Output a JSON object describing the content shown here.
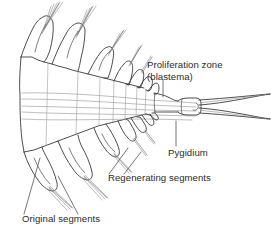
{
  "figure": {
    "background_color": "#ffffff",
    "ink_color": "#3a3a3a",
    "text_color": "#2b2b2b",
    "width": 271,
    "height": 238
  },
  "labels": {
    "proliferation_zone_line1": "Proliferation zone",
    "proliferation_zone_line2": "(blastema)",
    "pygidium": "Pygidium",
    "regenerating_segments": "Regenerating segments",
    "original_segments": "Original segments"
  },
  "annotations": [
    {
      "id": "proliferation-zone",
      "text": "Proliferation zone (blastema)",
      "text_x": 147,
      "text_y": 68,
      "leader_from": [
        163,
        80
      ],
      "leader_to": [
        163,
        97
      ]
    },
    {
      "id": "pygidium",
      "text": "Pygidium",
      "text_x": 168,
      "text_y": 155,
      "leader_from": [
        176,
        121
      ],
      "leader_to": [
        176,
        146
      ]
    },
    {
      "id": "regenerating-segments",
      "text": "Regenerating segments",
      "text_x": 108,
      "text_y": 180,
      "leader_count": 2
    },
    {
      "id": "original-segments",
      "text": "Original segments",
      "text_x": 22,
      "text_y": 222,
      "leader_count": 2
    }
  ],
  "anatomy": {
    "original_segment_count": 3,
    "regenerating_segment_count": 5,
    "pygidium_cerci_count": 2,
    "orientation": "anterior-left-posterior-right",
    "parts": [
      "original segments",
      "regenerating segments",
      "proliferation zone (blastema)",
      "pygidium",
      "cerci",
      "parapodia",
      "chaetae"
    ]
  }
}
